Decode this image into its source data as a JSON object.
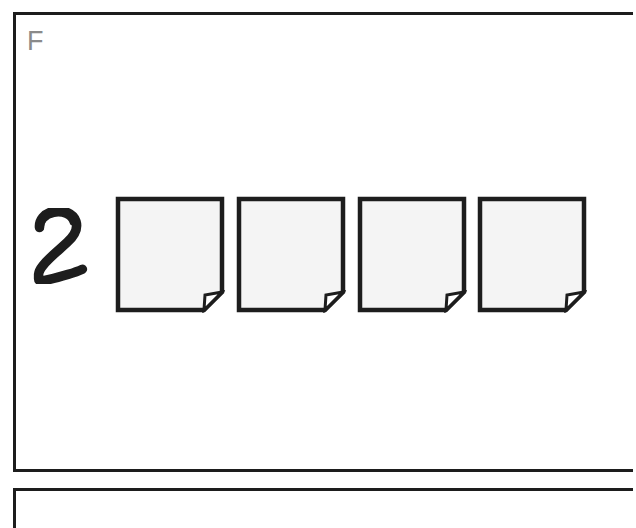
{
  "figure": {
    "type": "instruction-step-diagram",
    "background_color": "#ffffff",
    "ink_color": "#1d1d1d"
  },
  "panel_main": {
    "label": "F",
    "label_color": "#8a8a8a",
    "border_color": "#1d1d1d",
    "border_width_px": 3,
    "cropped_right": true
  },
  "step": {
    "number": "2",
    "number_style": "hand-drawn",
    "number_color": "#1d1d1d"
  },
  "documents": {
    "count": 4,
    "icon": "document-folded-corner-icon",
    "fill_color": "#f4f4f4",
    "outline_color": "#1d1d1d",
    "fold_corner": "bottom-right",
    "items": [
      {
        "index": "1",
        "alt": "sheet-1"
      },
      {
        "index": "2",
        "alt": "sheet-2"
      },
      {
        "index": "3",
        "alt": "sheet-3"
      },
      {
        "index": "4",
        "alt": "sheet-4"
      }
    ]
  },
  "panel_next": {
    "label": "",
    "border_color": "#1d1d1d",
    "cropped_bottom": true
  }
}
